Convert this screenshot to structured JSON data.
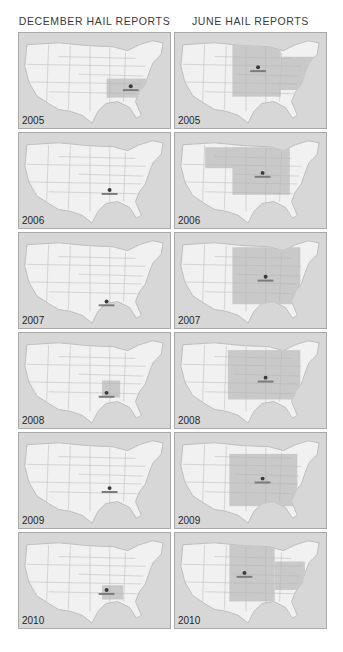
{
  "figure": {
    "columns": [
      {
        "title": "DECEMBER HAIL REPORTS"
      },
      {
        "title": "JUNE HAIL REPORTS"
      }
    ],
    "colors": {
      "ocean": "#d7d7d7",
      "land": "#f1f1f1",
      "shaded": "#c9c9c9",
      "borders": "#b4b4b4",
      "marker": "#3b3b3b",
      "frame": "#a9a9a9"
    },
    "rows": [
      {
        "year": "2005",
        "december": {
          "marker": [
            0.74,
            0.56
          ],
          "shade": [
            [
              0.58,
              0.48,
              0.26,
              0.2
            ]
          ]
        },
        "june": {
          "marker": [
            0.55,
            0.36
          ],
          "shade": [
            [
              0.38,
              0.12,
              0.32,
              0.55
            ],
            [
              0.7,
              0.25,
              0.22,
              0.35
            ]
          ]
        }
      },
      {
        "year": "2006",
        "december": {
          "marker": [
            0.6,
            0.6
          ],
          "shade": []
        },
        "june": {
          "marker": [
            0.58,
            0.42
          ],
          "shade": [
            [
              0.2,
              0.15,
              0.25,
              0.22
            ],
            [
              0.38,
              0.15,
              0.38,
              0.5
            ]
          ]
        }
      },
      {
        "year": "2007",
        "december": {
          "marker": [
            0.58,
            0.72
          ],
          "shade": []
        },
        "june": {
          "marker": [
            0.6,
            0.46
          ],
          "shade": [
            [
              0.38,
              0.15,
              0.45,
              0.6
            ]
          ]
        }
      },
      {
        "year": "2008",
        "december": {
          "marker": [
            0.58,
            0.63
          ],
          "shade": [
            [
              0.55,
              0.5,
              0.12,
              0.18
            ]
          ]
        },
        "june": {
          "marker": [
            0.6,
            0.47
          ],
          "shade": [
            [
              0.35,
              0.18,
              0.48,
              0.52
            ]
          ]
        }
      },
      {
        "year": "2009",
        "december": {
          "marker": [
            0.6,
            0.58
          ],
          "shade": []
        },
        "june": {
          "marker": [
            0.58,
            0.48
          ],
          "shade": [
            [
              0.36,
              0.22,
              0.45,
              0.55
            ]
          ]
        }
      },
      {
        "year": "2010",
        "december": {
          "marker": [
            0.58,
            0.6
          ],
          "shade": [
            [
              0.55,
              0.55,
              0.14,
              0.15
            ]
          ]
        },
        "june": {
          "marker": [
            0.46,
            0.42
          ],
          "shade": [
            [
              0.36,
              0.12,
              0.3,
              0.6
            ],
            [
              0.66,
              0.3,
              0.2,
              0.3
            ]
          ]
        }
      }
    ]
  }
}
